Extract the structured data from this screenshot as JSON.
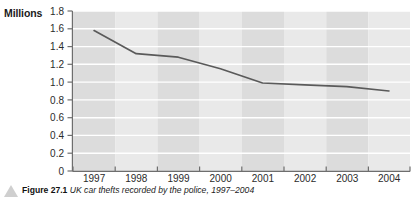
{
  "figure": {
    "unit_title": "Millions",
    "caption_number": "Figure 27.1",
    "caption_text": "UK car thefts recorded by the police, 1997–2004",
    "marker_icon": "triangle-bullet-icon"
  },
  "chart_data": {
    "type": "line",
    "title": "",
    "subtitle": "",
    "xlabel": "",
    "ylabel": "Millions",
    "categories": [
      "1997",
      "1998",
      "1999",
      "2000",
      "2001",
      "2002",
      "2003",
      "2004"
    ],
    "values": [
      1.58,
      1.32,
      1.28,
      1.15,
      0.99,
      0.97,
      0.95,
      0.9
    ],
    "series": [
      {
        "name": "Millions",
        "values": [
          1.58,
          1.32,
          1.28,
          1.15,
          0.99,
          0.97,
          0.95,
          0.9
        ]
      }
    ],
    "ylim": [
      0,
      1.8
    ],
    "ytick_labels": [
      "1.8",
      "1.6",
      "1.4",
      "1.2",
      "1.0",
      "0.8",
      "0.6",
      "0.4",
      "0.2",
      "0"
    ],
    "ytick_values": [
      1.8,
      1.6,
      1.4,
      1.2,
      1.0,
      0.8,
      0.6,
      0.4,
      0.2,
      0
    ],
    "xtick_labels": [
      "1997",
      "1998",
      "1999",
      "2000",
      "2001",
      "2002",
      "2003",
      "2004"
    ],
    "grid": "horizontal-white-gridlines",
    "legend": "none",
    "legend_position": "none",
    "plot_background": "alternating-vertical-gray-bands",
    "colors": {
      "line": "#5a5a5a",
      "band_dark": "#dcdcdc",
      "band_light": "#e9e9e9",
      "gridline": "#ffffff",
      "axis": "#6e6e6e",
      "text": "#2b2b2b"
    }
  }
}
